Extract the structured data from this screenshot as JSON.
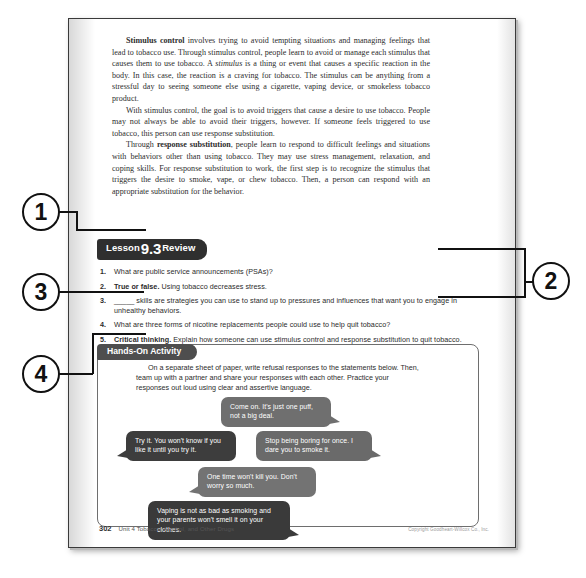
{
  "page": {
    "body_paragraphs": [
      {
        "runs": [
          {
            "text": "Stimulus control",
            "style": "bold"
          },
          {
            "text": " involves trying to avoid tempting situations and managing feelings that lead to tobacco use. Through stimulus control, people learn to avoid or manage each stimulus that causes them to use tobacco. A ",
            "style": "normal"
          },
          {
            "text": "stimulus",
            "style": "italic"
          },
          {
            "text": " is a thing or event that causes a specific reaction in the body. In this case, the reaction is a craving for tobacco. The stimulus can be anything from a stressful day to seeing someone else using a cigarette, vaping device, or smokeless tobacco product.",
            "style": "normal"
          }
        ]
      },
      {
        "runs": [
          {
            "text": "With stimulus control, the goal is to avoid triggers that cause a desire to use tobacco. People may not always be able to avoid their triggers, however. If someone feels triggered to use tobacco, this person can use response substitution.",
            "style": "normal"
          }
        ]
      },
      {
        "runs": [
          {
            "text": "Through ",
            "style": "normal"
          },
          {
            "text": "response substitution",
            "style": "bold"
          },
          {
            "text": ", people learn to respond to difficult feelings and situations with behaviors other than using tobacco. They may use stress management, relaxation, and coping skills. For response substitution to work, the first step is to recognize the stimulus that triggers the desire to smoke, vape, or chew tobacco. Then, a person can respond with an appropriate substitution for the behavior.",
            "style": "normal"
          }
        ]
      }
    ],
    "review": {
      "tab_label_left": "Lesson",
      "tab_number": "9.3",
      "tab_label_right": "Review",
      "questions": [
        {
          "num": "1.",
          "lead": "",
          "text": "What are public service announcements (PSAs)?"
        },
        {
          "num": "2.",
          "lead": "True or false.",
          "text": " Using tobacco decreases stress."
        },
        {
          "num": "3.",
          "lead": "",
          "text": "_____ skills are strategies you can use to stand up to pressures and influences that want you to engage in unhealthy behaviors."
        },
        {
          "num": "4.",
          "lead": "",
          "text": "What are three forms of nicotine replacements people could use to help quit tobacco?"
        },
        {
          "num": "5.",
          "lead": "Critical thinking.",
          "text": " Explain how someone can use stimulus control and response substitution to quit tobacco."
        }
      ]
    },
    "activity": {
      "tab_label": "Hands-On Activity",
      "intro": "On a separate sheet of paper, write refusal responses to the statements below. Then, team up with a partner and share your responses with each other. Practice your responses out loud using clear and assertive language.",
      "bubbles": [
        {
          "id": "bubble-1",
          "text": "Come on. It's just one puff, not a big deal."
        },
        {
          "id": "bubble-2",
          "text": "Try it. You won't know if you like it until you try it."
        },
        {
          "id": "bubble-3",
          "text": "Stop being boring for once. I dare you to smoke it."
        },
        {
          "id": "bubble-4",
          "text": "One time won't kill you. Don't worry so much."
        },
        {
          "id": "bubble-5",
          "text": "Vaping is not as bad as smoking and your parents won't smell it on your clothes."
        }
      ]
    },
    "footer": {
      "page_number": "302",
      "unit_text": "Unit 4   Tobacco, Alcohol, and Other Drugs",
      "copyright": "Copyright Goodheart-Willcox Co., Inc."
    }
  },
  "callouts": [
    {
      "id": "callout-1",
      "label": "1"
    },
    {
      "id": "callout-2",
      "label": "2"
    },
    {
      "id": "callout-3",
      "label": "3"
    },
    {
      "id": "callout-4",
      "label": "4"
    }
  ],
  "colors": {
    "review_tab": "#2f2f2f",
    "activity_tab": "#4e4e4e",
    "callout_outline": "#111111",
    "page_border": "#3a3a3a"
  }
}
